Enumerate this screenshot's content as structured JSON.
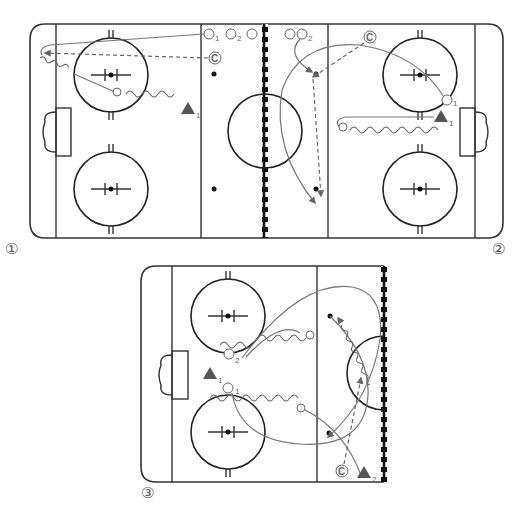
{
  "diagrams": [
    {
      "id": 1,
      "label": "①"
    },
    {
      "id": 2,
      "label": "②"
    },
    {
      "id": 3,
      "label": "③"
    }
  ],
  "labels": {
    "d1_p1": "1",
    "d1_p2": "2",
    "d1_triangle": "1",
    "d1_coach": "C",
    "d2_p2": "2",
    "d2_p1": "1",
    "d2_triangle": "1",
    "d2_coach": "C",
    "d3_p2": "2",
    "d3_p1": "1",
    "d3_triangle1": "1",
    "d3_triangle2": "2",
    "d3_coach": "C"
  },
  "colors": {
    "rink_line": "#333333",
    "path": "#777777",
    "player_triangle": "#555555",
    "background": "#ffffff"
  }
}
